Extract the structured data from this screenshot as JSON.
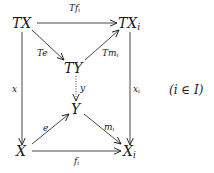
{
  "diagram": {
    "type": "commutative-diagram",
    "objects": {
      "TX": {
        "main": "TX",
        "sub": ""
      },
      "TXi": {
        "main": "TX",
        "sub": "i"
      },
      "TY": {
        "main": "TY",
        "sub": ""
      },
      "Y": {
        "main": "Y",
        "sub": ""
      },
      "X": {
        "main": "X",
        "sub": ""
      },
      "Xi": {
        "main": "X",
        "sub": "i"
      }
    },
    "morphisms": {
      "Tfi": {
        "main": "Tf",
        "sub": "i",
        "from": "TX",
        "to": "TXi",
        "style": "solid"
      },
      "Te": {
        "main": "Te",
        "sub": "",
        "from": "TX",
        "to": "TY",
        "style": "solid"
      },
      "Tmi": {
        "main": "Tm",
        "sub": "i",
        "from": "TY",
        "to": "TXi",
        "style": "solid"
      },
      "x": {
        "main": "x",
        "sub": "",
        "from": "TX",
        "to": "X",
        "style": "solid"
      },
      "y": {
        "main": "y",
        "sub": "",
        "from": "TY",
        "to": "Y",
        "style": "dotted"
      },
      "xi": {
        "main": "x",
        "sub": "i",
        "from": "TXi",
        "to": "Xi",
        "style": "solid"
      },
      "e": {
        "main": "e",
        "sub": "",
        "from": "X",
        "to": "Y",
        "style": "solid"
      },
      "mi": {
        "main": "m",
        "sub": "i",
        "from": "Y",
        "to": "Xi",
        "style": "solid"
      },
      "fi": {
        "main": "f",
        "sub": "i",
        "from": "X",
        "to": "Xi",
        "style": "solid"
      }
    },
    "condition": "(i ∈ I)",
    "colors": {
      "ink": "#1a1a1a",
      "background": "#ffffff"
    }
  }
}
